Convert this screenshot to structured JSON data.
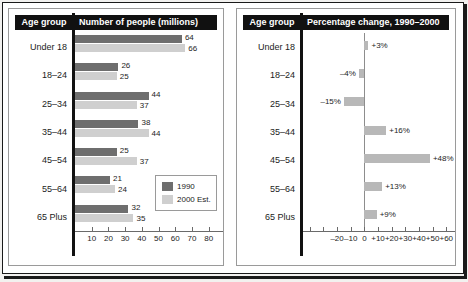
{
  "chart_data": [
    {
      "type": "bar",
      "panel": "left",
      "title": "Number of people (millions)",
      "category_header": "Age group",
      "orientation": "horizontal",
      "categories": [
        "Under 18",
        "18–24",
        "25–34",
        "35–44",
        "45–54",
        "55–64",
        "65 Plus"
      ],
      "series": [
        {
          "name": "1990",
          "color": "#6e6e6e",
          "values": [
            64,
            26,
            44,
            38,
            25,
            21,
            32
          ]
        },
        {
          "name": "2000 Est.",
          "color": "#cfcfcf",
          "values": [
            66,
            25,
            37,
            44,
            37,
            24,
            35
          ]
        }
      ],
      "value_labels": [
        [
          "64",
          "66"
        ],
        [
          "26",
          "25"
        ],
        [
          "44",
          "37"
        ],
        [
          "38",
          "44"
        ],
        [
          "25",
          "37"
        ],
        [
          "21",
          "24"
        ],
        [
          "32",
          "35"
        ]
      ],
      "xlabel": "",
      "ylabel": "",
      "xlim": [
        0,
        85
      ],
      "xticks": [
        10,
        20,
        30,
        40,
        50,
        60,
        70,
        80
      ],
      "xticklabels": [
        "10",
        "20",
        "30",
        "40",
        "50",
        "60",
        "70",
        "80"
      ],
      "grid": false,
      "legend": {
        "position": "lower-right",
        "entries": [
          "1990",
          "2000 Est."
        ]
      }
    },
    {
      "type": "bar",
      "panel": "right",
      "title": "Percentage change, 1990–2000",
      "category_header": "Age group",
      "orientation": "horizontal",
      "categories": [
        "Under 18",
        "18–24",
        "25–34",
        "35–44",
        "45–54",
        "55–64",
        "65 Plus"
      ],
      "values": [
        3,
        -4,
        -15,
        16,
        48,
        13,
        9
      ],
      "value_labels": [
        "+3%",
        "–4%",
        "–15%",
        "+16%",
        "+48%",
        "+13%",
        "+9%"
      ],
      "bar_color": "#b8b8b8",
      "xlabel": "",
      "ylabel": "",
      "xlim": [
        -45,
        62
      ],
      "xticks": [
        -40,
        -30,
        -20,
        -10,
        0,
        10,
        20,
        30,
        40,
        50,
        60
      ],
      "xticklabels": [
        "",
        "",
        "–20",
        "–10",
        "0",
        "+10",
        "+20",
        "+30",
        "+40",
        "+50",
        "+60"
      ],
      "zero_line": 0,
      "grid": false,
      "legend": null
    }
  ],
  "left_panel": {
    "header_age": "Age group",
    "header_main": "Number of people (millions)",
    "legend": {
      "item_1990": "1990",
      "item_2000": "2000 Est."
    }
  },
  "right_panel": {
    "header_age": "Age group",
    "header_main": "Percentage change, 1990–2000"
  }
}
